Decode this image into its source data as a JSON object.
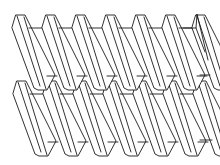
{
  "diagram": {
    "title": "",
    "colors": {
      "stroke": "#1a1a1a",
      "background": "#ffffff"
    },
    "rows": [
      {
        "name": "upper-row",
        "top_y": 15,
        "bottom_y": 90,
        "start_x": 16,
        "fin_count": 7,
        "pitch": 30
      },
      {
        "name": "lower-row",
        "top_y": 81,
        "bottom_y": 156,
        "start_x": 17,
        "fin_count": 7,
        "pitch": 30
      }
    ],
    "fin": {
      "cap_width": 9,
      "chamfer_dx": -4,
      "chamfer_dy": 13,
      "slant_dx": 22,
      "thickness": 8,
      "web_y_offset": 13
    }
  }
}
